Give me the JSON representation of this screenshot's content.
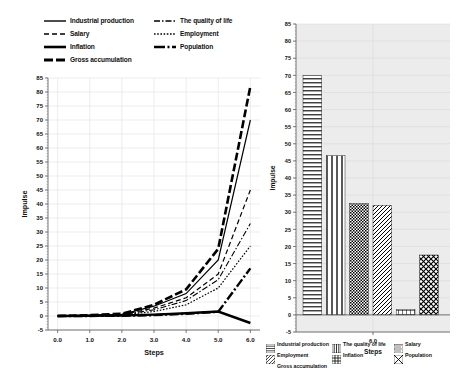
{
  "line_legend": {
    "entries": [
      {
        "label": "Industrial production",
        "style": "solid"
      },
      {
        "label": "The quality of life",
        "style": "dash-dot"
      },
      {
        "label": "Salary",
        "style": "dashed"
      },
      {
        "label": "Employment",
        "style": "dotted"
      },
      {
        "label": "Inflation",
        "style": "solid-thick"
      },
      {
        "label": "Population",
        "style": "dash-dot-thick"
      },
      {
        "label": "Gross accumulation",
        "style": "dashed-thick"
      }
    ]
  },
  "bar_legend": {
    "entries": [
      {
        "label": "Industrial production",
        "pattern": "horizontal-lines"
      },
      {
        "label": "The quality of life",
        "pattern": "vertical-lines"
      },
      {
        "label": "Salary",
        "pattern": "dense-checker"
      },
      {
        "label": "Employment",
        "pattern": "diagonal-lines"
      },
      {
        "label": "Inflation",
        "pattern": "grid"
      },
      {
        "label": "Population",
        "pattern": "cross-checker"
      },
      {
        "label": "Gross accumulation",
        "pattern": "none"
      }
    ]
  },
  "chart_data": [
    {
      "type": "line",
      "title": "",
      "xlabel": "Steps",
      "ylabel": "Impulse",
      "xlim": [
        -0.3,
        6.3
      ],
      "ylim": [
        -5,
        85
      ],
      "ytick_step": 5,
      "grid": true,
      "legend_position": "top",
      "xticks": [
        "0.0",
        "1.0",
        "2.0",
        "3.0",
        "4.0",
        "5.0",
        "6.0"
      ],
      "yticks": [
        "-5",
        "0",
        "5",
        "10",
        "15",
        "20",
        "25",
        "30",
        "35",
        "40",
        "45",
        "50",
        "55",
        "60",
        "65",
        "70",
        "75",
        "80",
        "85"
      ],
      "x": [
        0,
        1,
        2,
        3,
        4,
        5,
        6
      ],
      "series": [
        {
          "name": "Industrial production",
          "style": "solid",
          "values": [
            0,
            0.2,
            0.6,
            3.5,
            8.0,
            20.0,
            70.0
          ]
        },
        {
          "name": "The quality of life",
          "style": "dash-dot",
          "values": [
            0,
            0.2,
            0.5,
            2.2,
            5.5,
            13.0,
            33.0
          ]
        },
        {
          "name": "Salary",
          "style": "dashed",
          "values": [
            0,
            0.2,
            0.5,
            2.8,
            6.5,
            15.0,
            45.0
          ]
        },
        {
          "name": "Employment",
          "style": "dotted",
          "values": [
            0,
            0.1,
            0.4,
            1.6,
            4.0,
            10.0,
            25.0
          ]
        },
        {
          "name": "Inflation",
          "style": "solid-thick",
          "values": [
            0,
            0.1,
            0.2,
            0.5,
            1.0,
            1.6,
            -2.5
          ]
        },
        {
          "name": "Population",
          "style": "dash-dot-thick",
          "values": [
            0,
            0.0,
            0.1,
            0.3,
            0.8,
            1.5,
            17.0
          ]
        },
        {
          "name": "Gross accumulation",
          "style": "dashed-thick",
          "values": [
            0,
            0.3,
            0.8,
            4.0,
            9.5,
            24.0,
            82.0
          ]
        }
      ]
    },
    {
      "type": "bar",
      "title": "",
      "xlabel": "Steps",
      "ylabel": "Impulse",
      "ylim": [
        -5,
        85
      ],
      "ytick_step": 5,
      "grid": true,
      "xticks": [
        "6.0"
      ],
      "yticks": [
        "-5",
        "0",
        "5",
        "10",
        "15",
        "20",
        "25",
        "30",
        "35",
        "40",
        "45",
        "50",
        "55",
        "60",
        "65",
        "70",
        "75",
        "80",
        "85"
      ],
      "categories": [
        "Industrial production",
        "The quality of life",
        "Salary",
        "Employment",
        "Inflation",
        "Population"
      ],
      "values": [
        70.0,
        46.5,
        32.5,
        32.0,
        1.5,
        17.5
      ],
      "patterns": [
        "horizontal-lines",
        "vertical-lines",
        "dense-checker",
        "diagonal-lines",
        "grid",
        "cross-checker"
      ]
    }
  ]
}
